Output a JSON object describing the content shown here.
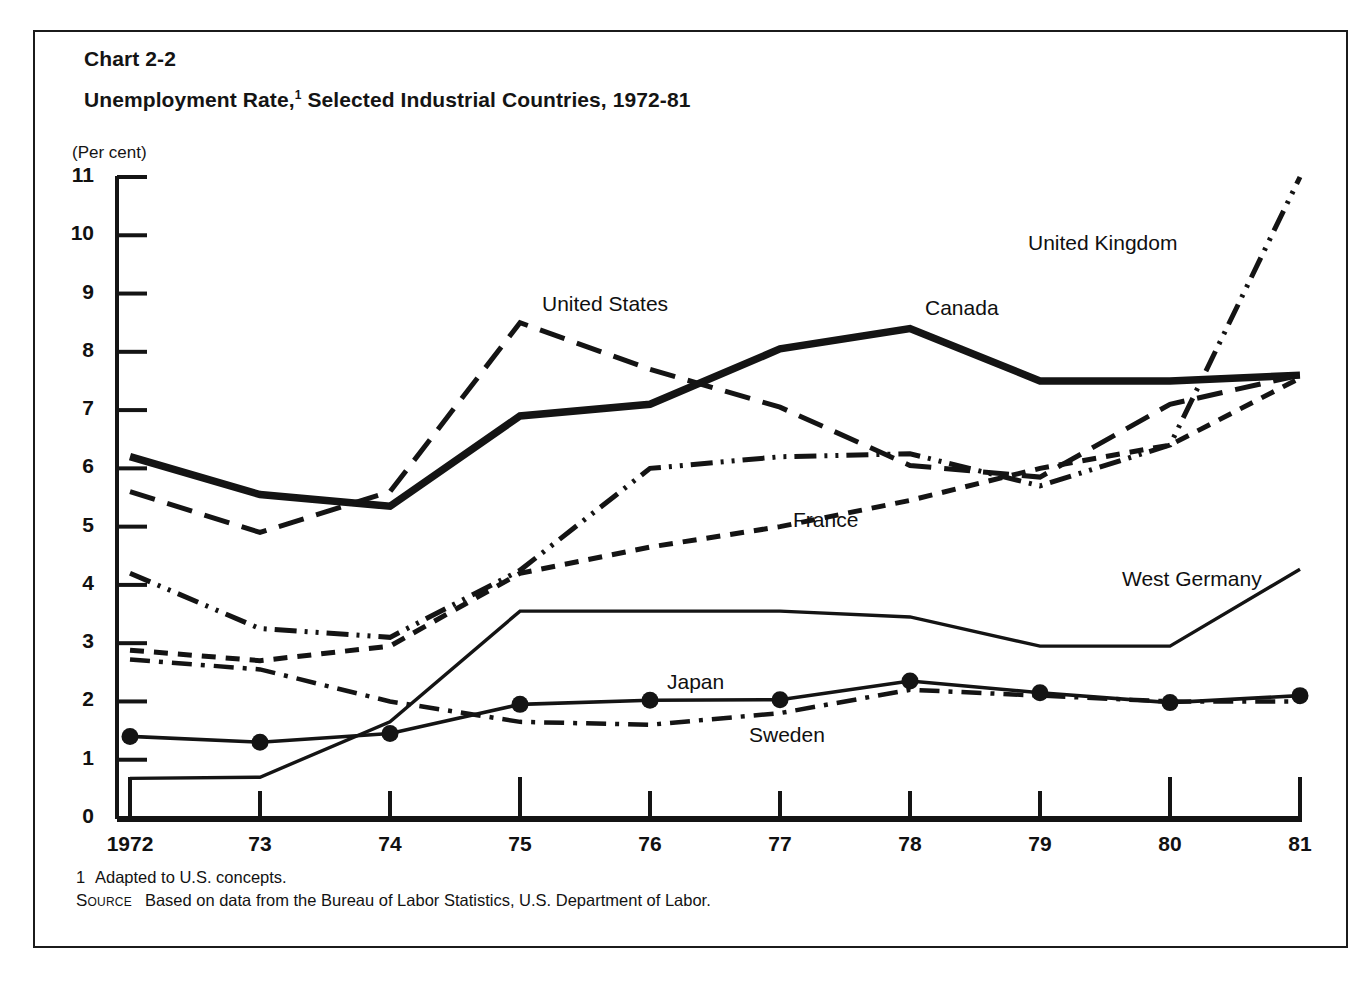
{
  "frame": {
    "chart_number": "Chart 2-2",
    "title_before": "Unemployment Rate,",
    "title_sup": "1",
    "title_after": " Selected Industrial Countries, 1972-81",
    "axis_unit": "(Per cent)"
  },
  "footnotes": {
    "note_marker": "1",
    "note_text": "Adapted to U.S. concepts.",
    "source_word": "Source",
    "source_text": "Based on data from the Bureau of Labor Statistics, U.S. Department of Labor."
  },
  "labels": {
    "united_states": "United States",
    "canada": "Canada",
    "united_kingdom": "United Kingdom",
    "france": "France",
    "west_germany": "West Germany",
    "japan": "Japan",
    "sweden": "Sweden"
  },
  "colors": {
    "ink": "#141414",
    "background": "#ffffff",
    "frame_border": "#1b1b1b"
  },
  "chart_data": {
    "type": "line",
    "subtitle": "Chart 2-2",
    "xlabel": "",
    "ylabel": "(Per cent)",
    "ylim": [
      0,
      11
    ],
    "xlim": [
      1972,
      1981
    ],
    "grid": false,
    "legend": "inline-annotations",
    "yticks": [
      0,
      1,
      2,
      3,
      4,
      5,
      6,
      7,
      8,
      9,
      10,
      11
    ],
    "ytick_labels": [
      "0",
      "1",
      "2",
      "3",
      "4",
      "5",
      "6",
      "7",
      "8",
      "9",
      "10",
      "11"
    ],
    "x": [
      1972,
      1973,
      1974,
      1975,
      1976,
      1977,
      1978,
      1979,
      1980,
      1981
    ],
    "xtick_labels": [
      "1972",
      "73",
      "74",
      "75",
      "76",
      "77",
      "78",
      "79",
      "80",
      "81"
    ],
    "series": [
      {
        "name": "Canada",
        "style": "thick-solid",
        "values": [
          6.2,
          5.55,
          5.35,
          6.9,
          7.1,
          8.05,
          8.4,
          7.5,
          7.5,
          7.6
        ]
      },
      {
        "name": "United States",
        "style": "long-dash",
        "values": [
          5.6,
          4.9,
          5.6,
          8.5,
          7.7,
          7.05,
          6.05,
          5.85,
          7.1,
          7.6
        ]
      },
      {
        "name": "United Kingdom",
        "style": "dash-dot-dot",
        "values": [
          4.2,
          3.25,
          3.1,
          4.25,
          6.0,
          6.2,
          6.25,
          5.7,
          6.4,
          11.0
        ]
      },
      {
        "name": "France",
        "style": "short-dash",
        "values": [
          2.88,
          2.7,
          2.95,
          4.2,
          4.65,
          5.0,
          5.45,
          6.0,
          6.4,
          7.55
        ]
      },
      {
        "name": "West Germany",
        "style": "thin-solid",
        "values": [
          0.68,
          0.7,
          1.65,
          3.55,
          3.55,
          3.55,
          3.45,
          2.95,
          2.95,
          4.27
        ]
      },
      {
        "name": "Japan",
        "style": "solid-with-markers",
        "values": [
          1.4,
          1.3,
          1.45,
          1.95,
          2.02,
          2.03,
          2.35,
          2.15,
          1.98,
          2.1
        ]
      },
      {
        "name": "Sweden",
        "style": "dash-dot",
        "values": [
          2.72,
          2.55,
          2.0,
          1.65,
          1.6,
          1.8,
          2.2,
          2.1,
          2.0,
          2.0
        ]
      }
    ]
  }
}
